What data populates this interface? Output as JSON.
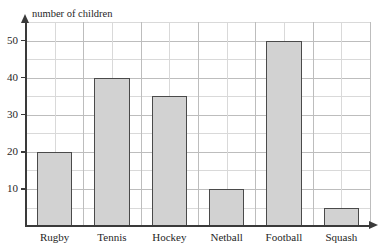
{
  "chart_data": {
    "type": "bar",
    "title": "",
    "subtitle": "",
    "xlabel": "",
    "ylabel": "number of children",
    "categories": [
      "Rugby",
      "Tennis",
      "Hockey",
      "Netball",
      "Football",
      "Squash"
    ],
    "values": [
      20,
      40,
      35,
      10,
      50,
      5
    ],
    "ylim": [
      0,
      55
    ],
    "ytick_labels": [
      "10",
      "20",
      "30",
      "40",
      "50"
    ],
    "ytick_values": [
      10,
      20,
      30,
      40,
      50
    ],
    "grid": true,
    "grid_minor_step": 5,
    "legend": null,
    "legend_position": "none",
    "annotations": [],
    "colors": {
      "bar_fill": "#d2d2d2",
      "bar_border": "#4a4a4a",
      "gridline": "#d9d9d9",
      "gridline_major": "#bdbdbd",
      "axis": "#3a3a3a",
      "text": "#262626",
      "background": "#ffffff"
    }
  },
  "axes": {
    "y_title": "number of children"
  },
  "top_remnant": "",
  "icons": {
    "y_axis_arrow": "arrow-up-icon",
    "x_axis_arrow": "arrow-right-icon"
  }
}
